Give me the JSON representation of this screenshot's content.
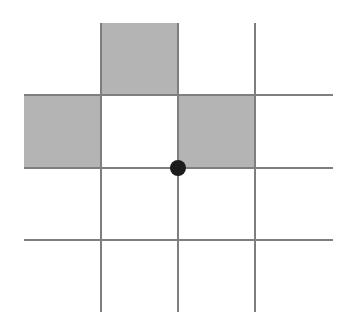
{
  "figure": {
    "background_color": "#ffffff",
    "border_color": "#434343",
    "gridline_color": "#7e7e7e",
    "shaded_cell_color": "#b4b4b4",
    "empty_cell_color": "#ffffff",
    "marker_color": "#1c1c1c"
  },
  "grid": {
    "rows": 4,
    "columns": 4,
    "cell_width": 77,
    "cell_height": 72,
    "origin_x": 24,
    "origin_y": 23,
    "total_width": 309,
    "total_height": 289,
    "border_width": 2,
    "gridline_width": 2,
    "column_edges_x": [
      0,
      77,
      154,
      231,
      309
    ],
    "row_edges_y": [
      0,
      72,
      145,
      217,
      289
    ]
  },
  "chart_data": {
    "type": "heatmap",
    "title": "",
    "xlabel": "",
    "ylabel": "",
    "categories_x": [
      "1",
      "2",
      "3",
      "4"
    ],
    "categories_y": [
      "1",
      "2",
      "3",
      "4"
    ],
    "legend": [
      {
        "label": "shaded",
        "value": 1,
        "color": "#b4b4b4"
      },
      {
        "label": "empty",
        "value": 0,
        "color": "#ffffff"
      }
    ],
    "values": [
      [
        0,
        1,
        0,
        0
      ],
      [
        1,
        0,
        1,
        0
      ],
      [
        0,
        0,
        0,
        0
      ],
      [
        0,
        0,
        0,
        0
      ]
    ],
    "shaded_cells": [
      {
        "row": 1,
        "column": 2
      },
      {
        "row": 2,
        "column": 1
      },
      {
        "row": 2,
        "column": 3
      }
    ],
    "annotations": [
      {
        "kind": "dot",
        "label": "marker",
        "grid_vertex_row": 2,
        "grid_vertex_column": 2,
        "x": 154,
        "y": 145,
        "radius": 8,
        "color": "#1c1c1c"
      }
    ]
  },
  "cells": [
    {
      "id": "r1c1",
      "row": 1,
      "column": 1,
      "x": 0,
      "y": 0,
      "w": 77,
      "h": 72,
      "state": "empty",
      "color": "#ffffff"
    },
    {
      "id": "r1c2",
      "row": 1,
      "column": 2,
      "x": 77,
      "y": 0,
      "w": 77,
      "h": 72,
      "state": "shaded",
      "color": "#b4b4b4"
    },
    {
      "id": "r1c3",
      "row": 1,
      "column": 3,
      "x": 154,
      "y": 0,
      "w": 77,
      "h": 72,
      "state": "empty",
      "color": "#ffffff"
    },
    {
      "id": "r1c4",
      "row": 1,
      "column": 4,
      "x": 231,
      "y": 0,
      "w": 78,
      "h": 72,
      "state": "empty",
      "color": "#ffffff"
    },
    {
      "id": "r2c1",
      "row": 2,
      "column": 1,
      "x": 0,
      "y": 72,
      "w": 77,
      "h": 73,
      "state": "shaded",
      "color": "#b4b4b4"
    },
    {
      "id": "r2c2",
      "row": 2,
      "column": 2,
      "x": 77,
      "y": 72,
      "w": 77,
      "h": 73,
      "state": "empty",
      "color": "#ffffff"
    },
    {
      "id": "r2c3",
      "row": 2,
      "column": 3,
      "x": 154,
      "y": 72,
      "w": 77,
      "h": 73,
      "state": "shaded",
      "color": "#b4b4b4"
    },
    {
      "id": "r2c4",
      "row": 2,
      "column": 4,
      "x": 231,
      "y": 72,
      "w": 78,
      "h": 73,
      "state": "empty",
      "color": "#ffffff"
    },
    {
      "id": "r3c1",
      "row": 3,
      "column": 1,
      "x": 0,
      "y": 145,
      "w": 77,
      "h": 72,
      "state": "empty",
      "color": "#ffffff"
    },
    {
      "id": "r3c2",
      "row": 3,
      "column": 2,
      "x": 77,
      "y": 145,
      "w": 77,
      "h": 72,
      "state": "empty",
      "color": "#ffffff"
    },
    {
      "id": "r3c3",
      "row": 3,
      "column": 3,
      "x": 154,
      "y": 145,
      "w": 77,
      "h": 72,
      "state": "empty",
      "color": "#ffffff"
    },
    {
      "id": "r3c4",
      "row": 3,
      "column": 4,
      "x": 231,
      "y": 145,
      "w": 78,
      "h": 72,
      "state": "empty",
      "color": "#ffffff"
    },
    {
      "id": "r4c1",
      "row": 4,
      "column": 1,
      "x": 0,
      "y": 217,
      "w": 77,
      "h": 72,
      "state": "empty",
      "color": "#ffffff"
    },
    {
      "id": "r4c2",
      "row": 4,
      "column": 2,
      "x": 77,
      "y": 217,
      "w": 77,
      "h": 72,
      "state": "empty",
      "color": "#ffffff"
    },
    {
      "id": "r4c3",
      "row": 4,
      "column": 3,
      "x": 154,
      "y": 217,
      "w": 77,
      "h": 72,
      "state": "empty",
      "color": "#ffffff"
    },
    {
      "id": "r4c4",
      "row": 4,
      "column": 4,
      "x": 231,
      "y": 217,
      "w": 78,
      "h": 72,
      "state": "empty",
      "color": "#ffffff"
    }
  ],
  "gridlines": {
    "vertical_x": [
      77,
      154,
      231
    ],
    "horizontal_y": [
      72,
      145,
      217
    ]
  },
  "marker": {
    "name": "center-dot",
    "cx": 154,
    "cy": 145,
    "r": 8,
    "color": "#1c1c1c"
  }
}
